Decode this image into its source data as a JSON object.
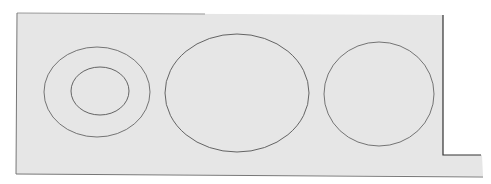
{
  "diagram": {
    "background": "#ffffff",
    "panel_fill": "#e6e6e6",
    "stroke": "#555555",
    "shapes": [
      {
        "name": "left-outer-ring",
        "cx": 97,
        "cy": 92,
        "rx": 53,
        "ry": 45
      },
      {
        "name": "left-inner-ring",
        "cx": 100,
        "cy": 91,
        "rx": 29,
        "ry": 24
      },
      {
        "name": "middle-large-ellipse",
        "cx": 237,
        "cy": 93,
        "rx": 72,
        "ry": 59
      },
      {
        "name": "right-circle",
        "cx": 379,
        "cy": 94,
        "rx": 55,
        "ry": 52
      }
    ]
  }
}
